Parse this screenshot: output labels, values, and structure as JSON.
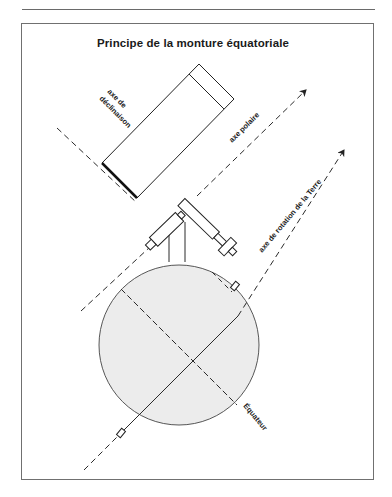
{
  "figure": {
    "title": "Principe de la monture équatoriale",
    "labels": {
      "declination_axis_line1": "axe de",
      "declination_axis_line2": "déclinaison",
      "polar_axis": "axe polaire",
      "earth_rotation_axis": "axe de rotation de la Terre",
      "equator": "Équateur"
    },
    "colors": {
      "line": "#2a2a2a",
      "earth_fill": "#ececec",
      "frame": "#707070"
    }
  }
}
